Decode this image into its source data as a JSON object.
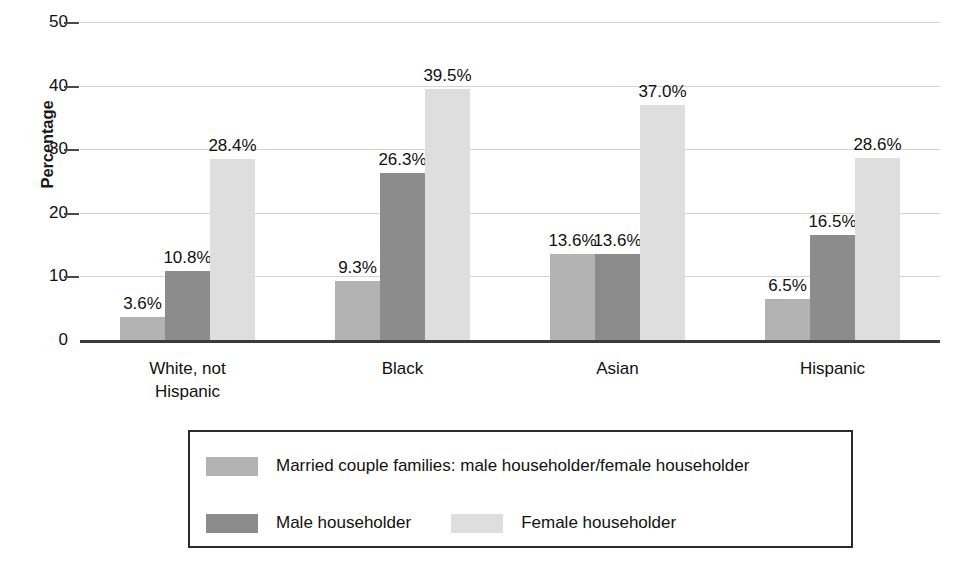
{
  "chart_data": {
    "type": "bar",
    "title": "",
    "xlabel": "",
    "ylabel": "Percentage",
    "ylim": [
      0,
      50
    ],
    "yticks": [
      0,
      10,
      20,
      30,
      40,
      50
    ],
    "grid": true,
    "legend_position": "bottom",
    "categories": [
      "White, not Hispanic",
      "Black",
      "Asian",
      "Hispanic"
    ],
    "category_lines": [
      [
        "White, not",
        "Hispanic"
      ],
      [
        "Black"
      ],
      [
        "Asian"
      ],
      [
        "Hispanic"
      ]
    ],
    "series": [
      {
        "name": "Married couple families: male householder/female householder",
        "color": "#b3b3b3",
        "values": [
          3.6,
          9.3,
          13.6,
          6.5
        ],
        "labels": [
          "3.6%",
          "9.3%",
          "13.6%",
          "6.5%"
        ]
      },
      {
        "name": "Male householder",
        "color": "#8c8c8c",
        "values": [
          10.8,
          26.3,
          13.6,
          16.5
        ],
        "labels": [
          "10.8%",
          "26.3%",
          "13.6%",
          "16.5%"
        ]
      },
      {
        "name": "Female householder",
        "color": "#dedede",
        "values": [
          28.4,
          39.5,
          37.0,
          28.6
        ],
        "labels": [
          "28.4%",
          "39.5%",
          "37.0%",
          "28.6%"
        ]
      }
    ]
  },
  "axis": {
    "y_title": "Percentage",
    "y_tick_labels": [
      "0",
      "10",
      "20",
      "30",
      "40",
      "50"
    ]
  },
  "legend": {
    "row1": [
      {
        "label": "Married couple families: male householder/female householder",
        "color": "#b3b3b3"
      }
    ],
    "row2": [
      {
        "label": "Male householder",
        "color": "#8c8c8c"
      },
      {
        "label": "Female householder",
        "color": "#dedede"
      }
    ]
  }
}
